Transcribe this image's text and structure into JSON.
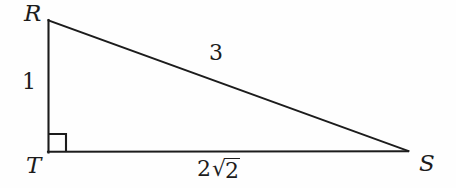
{
  "figure": {
    "type": "geometry-diagram",
    "shape": "right-triangle",
    "name": "triangle-RTS",
    "background_color": "#fefefe",
    "stroke_color": "#1c1c1c"
  },
  "vertices": {
    "R": {
      "label": "R",
      "x": 48,
      "y": 20
    },
    "T": {
      "label": "T",
      "x": 48,
      "y": 152
    },
    "S": {
      "label": "S",
      "x": 408,
      "y": 151
    }
  },
  "sides": {
    "vertical_leg": {
      "from": "R",
      "to": "T",
      "measure": "1"
    },
    "horizontal_leg": {
      "from": "T",
      "to": "S",
      "measure_coefficient": "2",
      "measure_radical": "√",
      "measure_radicand": "2",
      "measure_full": "2√2"
    },
    "hypotenuse": {
      "from": "R",
      "to": "S",
      "measure": "3"
    }
  },
  "right_angle": {
    "at_vertex": "T",
    "marker": "square",
    "size": 17
  }
}
